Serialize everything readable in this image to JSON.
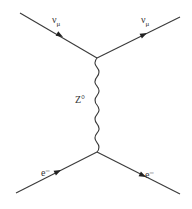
{
  "diagram": {
    "type": "feynman",
    "particles": {
      "incoming_neutrino": {
        "symbol": "ν",
        "subscript": "μ"
      },
      "outgoing_neutrino": {
        "symbol": "ν",
        "subscript": "μ"
      },
      "boson": {
        "symbol": "Z°"
      },
      "incoming_electron": {
        "symbol": "e⁻"
      },
      "outgoing_electron": {
        "symbol": "e⁻"
      }
    },
    "colors": {
      "line": "#3a3a3a",
      "background": "#ffffff"
    }
  }
}
